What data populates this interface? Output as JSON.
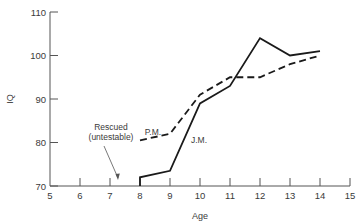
{
  "chart_data": {
    "type": "line",
    "title": "",
    "xlabel": "Age",
    "ylabel": "IQ",
    "xlim": [
      5,
      15
    ],
    "ylim": [
      70,
      110
    ],
    "x_ticks": [
      5,
      6,
      7,
      8,
      9,
      10,
      11,
      12,
      13,
      14,
      15
    ],
    "y_ticks": [
      70,
      80,
      90,
      100,
      110
    ],
    "grid": false,
    "legend": "none (series labeled inline)",
    "x": [
      8,
      9,
      10,
      11,
      12,
      13,
      14
    ],
    "series": [
      {
        "name": "J.M.",
        "style": "solid",
        "values": [
          72,
          73.5,
          89,
          93,
          104,
          100,
          101
        ]
      },
      {
        "name": "P.M.",
        "style": "dashed",
        "values": [
          80.5,
          82,
          91,
          95,
          95,
          98,
          100
        ]
      }
    ],
    "annotations": [
      {
        "text_line1": "Rescued",
        "text_line2": "(untestable)",
        "points_to_x": 7.4,
        "points_to_y": 71
      }
    ]
  },
  "labels": {
    "jm": "J.M.",
    "pm": "P.M.",
    "rescued_line1": "Rescued",
    "rescued_line2": "(untestable)",
    "xlabel": "Age",
    "ylabel": "IQ"
  }
}
